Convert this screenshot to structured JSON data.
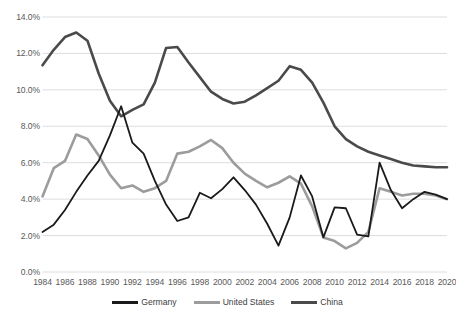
{
  "chart_data": {
    "type": "line",
    "title": "",
    "subtitle": "",
    "xlabel": "",
    "ylabel": "",
    "x": [
      1984,
      1985,
      1986,
      1987,
      1988,
      1989,
      1990,
      1991,
      1992,
      1993,
      1994,
      1995,
      1996,
      1997,
      1998,
      1999,
      2000,
      2001,
      2002,
      2003,
      2004,
      2005,
      2006,
      2007,
      2008,
      2009,
      2010,
      2011,
      2012,
      2013,
      2014,
      2015,
      2016,
      2017,
      2018,
      2019,
      2020
    ],
    "xlim": [
      1984,
      2020
    ],
    "ylim": [
      0.0,
      14.0
    ],
    "ytick_labels": [
      "0.0%",
      "2.0%",
      "4.0%",
      "6.0%",
      "8.0%",
      "10.0%",
      "12.0%",
      "14.0%"
    ],
    "ytick_values": [
      0.0,
      2.0,
      4.0,
      6.0,
      8.0,
      10.0,
      12.0,
      14.0
    ],
    "xtick_labels": [
      "1984",
      "1986",
      "1988",
      "1990",
      "1992",
      "1994",
      "1996",
      "1998",
      "2000",
      "2002",
      "2004",
      "2006",
      "2008",
      "2010",
      "2012",
      "2014",
      "2016",
      "2018",
      "2020"
    ],
    "xtick_values": [
      1984,
      1986,
      1988,
      1990,
      1992,
      1994,
      1996,
      1998,
      2000,
      2002,
      2004,
      2006,
      2008,
      2010,
      2012,
      2014,
      2016,
      2018,
      2020
    ],
    "grid": "horizontal",
    "legend_position": "bottom",
    "series": [
      {
        "name": "Germany",
        "color": "#1a1a1a",
        "width": 1.8,
        "values": [
          2.2,
          2.6,
          3.4,
          4.4,
          5.3,
          6.1,
          7.5,
          9.1,
          7.1,
          6.5,
          5.0,
          3.7,
          2.8,
          3.0,
          4.35,
          4.05,
          4.55,
          5.2,
          4.5,
          3.7,
          2.65,
          1.45,
          3.0,
          5.3,
          4.15,
          1.9,
          3.55,
          3.5,
          2.05,
          1.95,
          6.0,
          4.5,
          3.5,
          4.0,
          4.4,
          4.25,
          4.0
        ]
      },
      {
        "name": "United States",
        "color": "#9c9c9c",
        "width": 2.6,
        "values": [
          4.15,
          5.7,
          6.1,
          7.55,
          7.3,
          6.4,
          5.35,
          4.6,
          4.75,
          4.4,
          4.6,
          5.0,
          6.5,
          6.6,
          6.9,
          7.25,
          6.8,
          6.0,
          5.4,
          5.0,
          4.65,
          4.9,
          5.25,
          4.85,
          3.6,
          1.9,
          1.7,
          1.3,
          1.6,
          2.2,
          4.6,
          4.4,
          4.2,
          4.3,
          4.3,
          4.2,
          4.0
        ]
      },
      {
        "name": "China",
        "color": "#4a4a4a",
        "width": 2.6,
        "values": [
          11.35,
          12.2,
          12.9,
          13.15,
          12.7,
          10.9,
          9.4,
          8.55,
          8.9,
          9.2,
          10.4,
          12.3,
          12.35,
          11.5,
          10.7,
          9.9,
          9.5,
          9.25,
          9.35,
          9.7,
          10.1,
          10.5,
          11.3,
          11.1,
          10.4,
          9.3,
          8.0,
          7.3,
          6.9,
          6.6,
          6.4,
          6.2,
          6.0,
          5.85,
          5.8,
          5.75,
          5.75
        ]
      }
    ]
  },
  "legend": {
    "items": [
      {
        "label": "Germany"
      },
      {
        "label": "United States"
      },
      {
        "label": "China"
      }
    ]
  }
}
